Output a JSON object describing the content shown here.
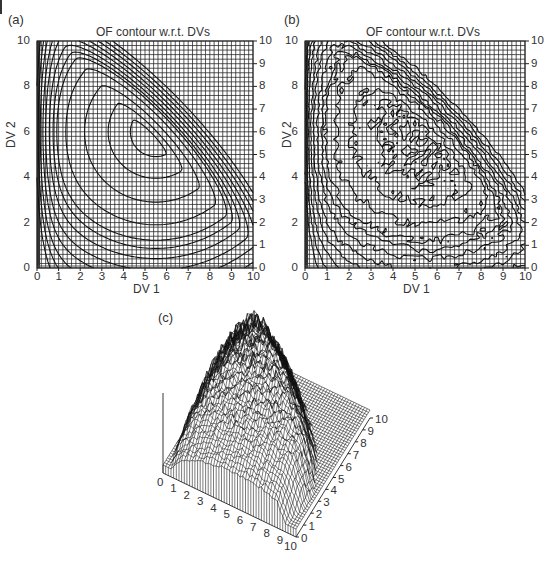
{
  "figure": {
    "panels": [
      "(a)",
      "(b)",
      "(c)"
    ]
  },
  "chart_data": [
    {
      "id": "a",
      "panel_label": "(a)",
      "type": "contour",
      "title": "OF contour w.r.t. DVs",
      "xlabel": "DV 1",
      "ylabel": "DV 2",
      "xlim": [
        0,
        10
      ],
      "ylim": [
        0,
        10
      ],
      "x_ticks": [
        "0",
        "1",
        "2",
        "3",
        "4",
        "5",
        "6",
        "7",
        "8",
        "9",
        "10"
      ],
      "y_ticks_left": [
        "0",
        "2",
        "4",
        "6",
        "8",
        "10"
      ],
      "y_ticks_right": [
        "0",
        "1",
        "2",
        "3",
        "4",
        "5",
        "6",
        "7",
        "8",
        "9",
        "10"
      ],
      "grid": true,
      "grid_cells": 50,
      "smooth": true,
      "contour_levels_description": "Smooth nested arcs peaking near DV1≈5.5, DV2≈6; dense parallel diagonal lines in upper-right corner; tight curves near DV1=0"
    },
    {
      "id": "b",
      "panel_label": "(b)",
      "type": "contour",
      "title": "OF contour w.r.t. DVs",
      "xlabel": "DV 1",
      "ylabel": "DV 2",
      "xlim": [
        0,
        10
      ],
      "ylim": [
        0,
        10
      ],
      "x_ticks": [
        "0",
        "1",
        "2",
        "3",
        "4",
        "5",
        "6",
        "7",
        "8",
        "9",
        "10"
      ],
      "y_ticks_left": [
        "0",
        "2",
        "4",
        "6",
        "8",
        "10"
      ],
      "y_ticks_right": [
        "0",
        "1",
        "2",
        "3",
        "4",
        "5",
        "6",
        "7",
        "8",
        "9",
        "10"
      ],
      "grid": true,
      "grid_cells": 50,
      "smooth": false,
      "contour_levels_description": "Noisy version of (a): jagged contours with many small closed islands, especially in upper-right region"
    },
    {
      "id": "c",
      "panel_label": "(c)",
      "type": "surface3d",
      "x_ticks": [
        "0",
        "1",
        "2",
        "3",
        "4",
        "5",
        "6",
        "7",
        "8",
        "9",
        "10"
      ],
      "y_ticks": [
        "0",
        "1",
        "2",
        "3",
        "4",
        "5",
        "6",
        "7",
        "8",
        "9",
        "10"
      ],
      "xlim": [
        0,
        10
      ],
      "ylim": [
        0,
        10
      ],
      "mesh": 50,
      "description": "Noisy wireframe surface of the objective function over DV1 and DV2"
    }
  ]
}
